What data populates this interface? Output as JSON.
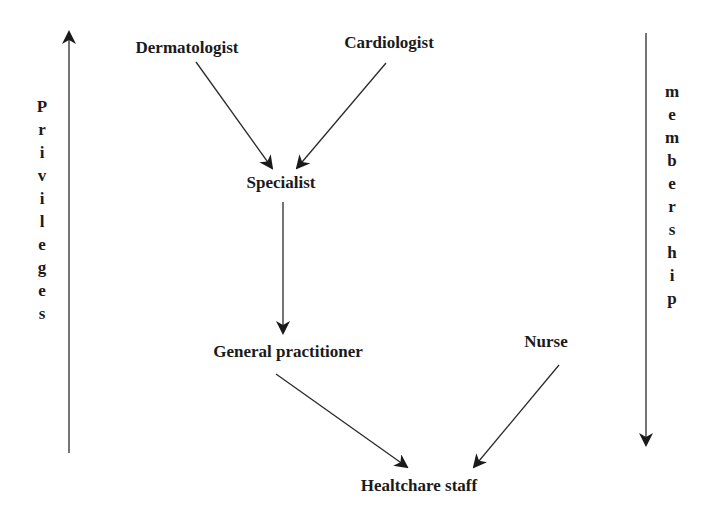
{
  "diagram": {
    "nodes": [
      {
        "id": "dermatologist",
        "label": "Dermatologist",
        "x": 187,
        "y": 48
      },
      {
        "id": "cardiologist",
        "label": "Cardiologist",
        "x": 389,
        "y": 43
      },
      {
        "id": "specialist",
        "label": "Specialist",
        "x": 281,
        "y": 183
      },
      {
        "id": "general_practitioner",
        "label": "General practitioner",
        "x": 288,
        "y": 352
      },
      {
        "id": "nurse",
        "label": "Nurse",
        "x": 546,
        "y": 342
      },
      {
        "id": "healthcare_staff",
        "label": "Healtchare staff",
        "x": 419,
        "y": 486
      }
    ],
    "edges": [
      {
        "from": "dermatologist",
        "to": "specialist",
        "x1": 196,
        "y1": 62,
        "x2": 272,
        "y2": 168
      },
      {
        "from": "cardiologist",
        "to": "specialist",
        "x1": 386,
        "y1": 63,
        "x2": 297,
        "y2": 168
      },
      {
        "from": "specialist",
        "to": "general_practitioner",
        "x1": 283,
        "y1": 202,
        "x2": 283,
        "y2": 333
      },
      {
        "from": "general_practitioner",
        "to": "healthcare_staff",
        "x1": 276,
        "y1": 374,
        "x2": 407,
        "y2": 467
      },
      {
        "from": "nurse",
        "to": "healthcare_staff",
        "x1": 559,
        "y1": 365,
        "x2": 474,
        "y2": 467
      }
    ],
    "axes": {
      "left": {
        "label": "Privileges",
        "direction": "up",
        "x": 69,
        "y_start": 453,
        "y_end": 32,
        "label_x": 42,
        "label_y": 95
      },
      "right": {
        "label": "membership",
        "direction": "down",
        "x": 646,
        "y_start": 33,
        "y_end": 445,
        "label_x": 672,
        "label_y": 80
      }
    },
    "colors": {
      "line": "#2a2a2a",
      "text": "#1a1a1a",
      "background": "#ffffff"
    }
  }
}
